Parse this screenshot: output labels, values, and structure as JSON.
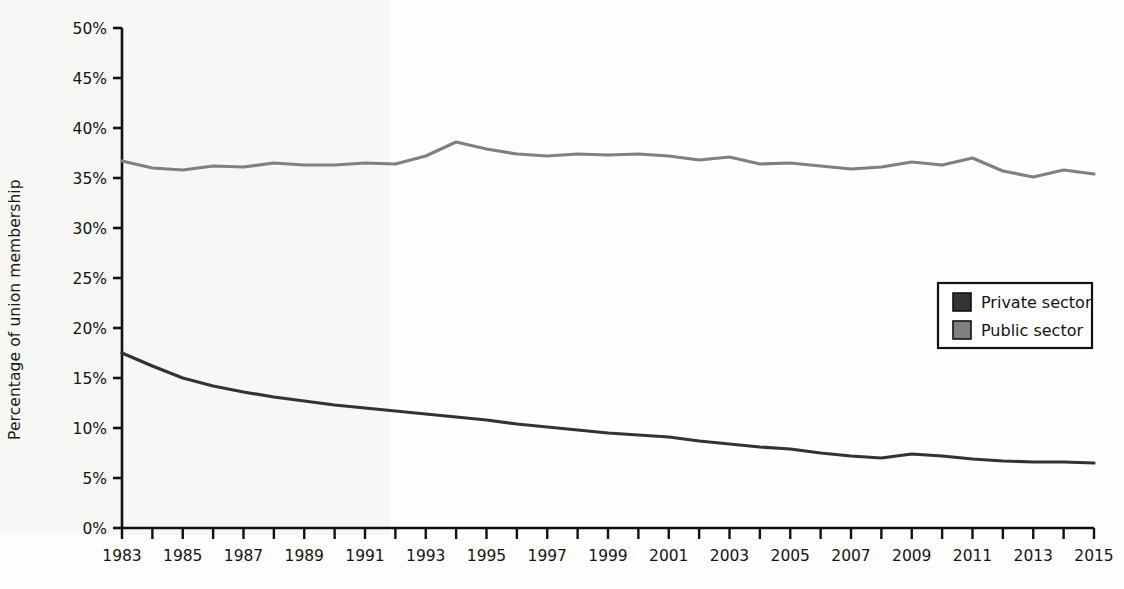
{
  "chart_data": {
    "type": "line",
    "title": "",
    "xlabel": "",
    "ylabel": "Percentage of union membership",
    "xlim": [
      1983,
      2015
    ],
    "ylim": [
      0,
      50
    ],
    "y_tick_step": 5,
    "x_tick_step": 1,
    "x_label_step": 2,
    "grid": false,
    "legend_position": "right-middle",
    "y_ticks": [
      "0%",
      "5%",
      "10%",
      "15%",
      "20%",
      "25%",
      "30%",
      "35%",
      "40%",
      "45%",
      "50%"
    ],
    "x_ticks": [
      "1983",
      "1985",
      "1987",
      "1989",
      "1991",
      "1993",
      "1995",
      "1997",
      "1999",
      "2001",
      "2003",
      "2005",
      "2007",
      "2009",
      "2011",
      "2013",
      "2015"
    ],
    "x": [
      1983,
      1984,
      1985,
      1986,
      1987,
      1988,
      1989,
      1990,
      1991,
      1992,
      1993,
      1994,
      1995,
      1996,
      1997,
      1998,
      1999,
      2000,
      2001,
      2002,
      2003,
      2004,
      2005,
      2006,
      2007,
      2008,
      2009,
      2010,
      2011,
      2012,
      2013,
      2014,
      2015
    ],
    "series": [
      {
        "name": "Private sector",
        "color": "#333333",
        "values": [
          17.5,
          16.2,
          15.0,
          14.2,
          13.6,
          13.1,
          12.7,
          12.3,
          12.0,
          11.7,
          11.4,
          11.1,
          10.8,
          10.4,
          10.1,
          9.8,
          9.5,
          9.3,
          9.1,
          8.7,
          8.4,
          8.1,
          7.9,
          7.5,
          7.2,
          7.0,
          7.4,
          7.2,
          6.9,
          6.7,
          6.6,
          6.6,
          6.5
        ]
      },
      {
        "name": "Public sector",
        "color": "#808080",
        "values": [
          36.7,
          36.0,
          35.8,
          36.2,
          36.1,
          36.5,
          36.3,
          36.3,
          36.5,
          36.4,
          37.2,
          38.6,
          37.9,
          37.4,
          37.2,
          37.4,
          37.3,
          37.4,
          37.2,
          36.8,
          37.1,
          36.4,
          36.5,
          36.2,
          35.9,
          36.1,
          36.6,
          36.3,
          37.0,
          35.7,
          35.1,
          35.8,
          35.4
        ]
      }
    ],
    "legend": [
      {
        "label": "Private sector",
        "color": "#333333",
        "swatch": "legend-swatch-private"
      },
      {
        "label": "Public sector",
        "color": "#808080",
        "swatch": "legend-swatch-public"
      }
    ]
  }
}
